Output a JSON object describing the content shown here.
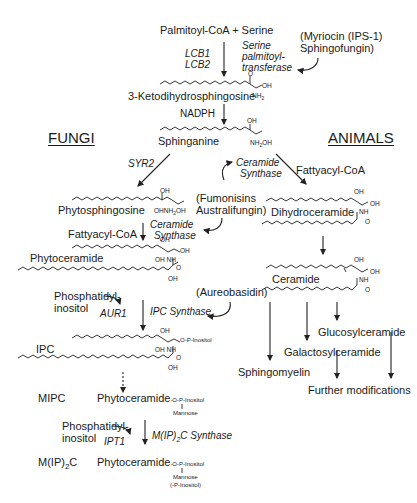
{
  "diagram": {
    "headers": {
      "fungi": "FUNGI",
      "animals": "ANIMALS"
    },
    "common": {
      "substrates": "Palmitoyl-CoA + Serine",
      "genes_spt": [
        "LCB1",
        "LCB2"
      ],
      "enzyme_spt": [
        "Serine",
        "palmitoyl-",
        "transferase"
      ],
      "inhibitor_spt": [
        "(Myriocin (IPS-1)",
        "Sphingofungin)"
      ],
      "ketodihydrosphingosine": "3-Ketodihydrosphingosine",
      "cofactor": "NADPH",
      "sphinganine": "Sphinganine"
    },
    "fungi": {
      "gene_syr2": "SYR2",
      "phytosphingosine": "Phytosphingosine",
      "fattyacyl": "Fattyacyl-CoA",
      "ceramide_synthase": [
        "Ceramide",
        "Synthase"
      ],
      "phytoceramide": "Phytoceramide",
      "phosphatidylinositol": [
        "Phosphatidyl-",
        "inositol"
      ],
      "gene_aur1": "AUR1",
      "ipc_synthase": "IPC Synthase",
      "ipc": "IPC",
      "mipc": "MIPC",
      "mipc_structure": {
        "base": "Phytoceramide",
        "tail": "-O-P-Inositol",
        "branch": "Mannose"
      },
      "phosphatidylinositol_2": [
        "Phosphatidyl-",
        "inositol"
      ],
      "gene_ipt1": "IPT1",
      "mip2c_synthase": "M(IP)2C Synthase",
      "mip2c": "M(IP)2C",
      "mip2c_structure": {
        "base": "Phytoceramide",
        "tail": "-O-P-Inositol",
        "branch": [
          "Mannose",
          "(-P-Inositol)"
        ]
      }
    },
    "inhibitors": {
      "fumonisins": [
        "(Fumonisins",
        "Australifungin)"
      ],
      "aureobasidin": "(Aureobasidin)"
    },
    "animals": {
      "ceramide_synthase": [
        "Ceramide",
        "Synthase"
      ],
      "fattyacyl": "Fattyacyl-CoA",
      "dihydroceramide": "Dihydroceramide",
      "ceramide": "Ceramide",
      "glucosylceramide": "Glucosylceramide",
      "galactosylceramide": "Galactosylceramide",
      "sphingomyelin": "Sphingomyelin",
      "further": "Further modifications"
    },
    "groups": {
      "oh": "OH",
      "nh2": "NH",
      "sub2": "2",
      "nh": "NH",
      "o": "O",
      "opi": "O-P-Inositol"
    }
  }
}
